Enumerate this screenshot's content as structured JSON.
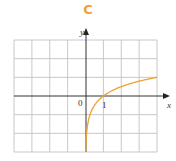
{
  "title": "C",
  "chart_data": {
    "type": "line",
    "title": "C",
    "xlabel": "x",
    "ylabel": "y",
    "xlim": [
      -4,
      4
    ],
    "ylim": [
      -3,
      3
    ],
    "grid": true,
    "tick_labels": {
      "origin": "0",
      "x_one": "1"
    },
    "series": [
      {
        "name": "y = log4(x)",
        "color": "#f0a030",
        "x": [
          0.016,
          0.05,
          0.1,
          0.25,
          0.5,
          1,
          1.5,
          2,
          2.5,
          3,
          3.5,
          4
        ],
        "y": [
          -3.0,
          -2.16,
          -1.66,
          -1.0,
          -0.5,
          0,
          0.29,
          0.5,
          0.66,
          0.79,
          0.9,
          1.0
        ]
      }
    ]
  },
  "colors": {
    "grid": "#c8c8c8",
    "axis": "#333333",
    "curve": "#f0a030",
    "title": "#f0a030"
  }
}
